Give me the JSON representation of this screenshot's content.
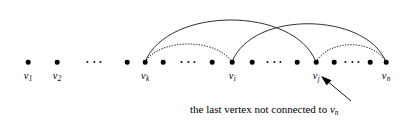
{
  "figure": {
    "width": 404,
    "height": 126,
    "background": "#ffffff",
    "ink_color": "#000000"
  },
  "vertices": [
    {
      "id": "v1",
      "label": "v",
      "sub": "1",
      "x": 28,
      "y": 62,
      "labeled": true
    },
    {
      "id": "v2",
      "label": "v",
      "sub": "2",
      "x": 57,
      "y": 62,
      "labeled": true
    },
    {
      "id": "a1",
      "label": "",
      "sub": "",
      "x": 127,
      "y": 62,
      "labeled": false
    },
    {
      "id": "vk",
      "label": "v",
      "sub": "k",
      "x": 145,
      "y": 62,
      "labeled": true
    },
    {
      "id": "a2",
      "label": "",
      "sub": "",
      "x": 163,
      "y": 62,
      "labeled": false
    },
    {
      "id": "a3",
      "label": "",
      "sub": "",
      "x": 212,
      "y": 62,
      "labeled": false
    },
    {
      "id": "vi",
      "label": "v",
      "sub": "i",
      "x": 232,
      "y": 62,
      "labeled": true
    },
    {
      "id": "a4",
      "label": "",
      "sub": "",
      "x": 252,
      "y": 62,
      "labeled": false
    },
    {
      "id": "a5",
      "label": "",
      "sub": "",
      "x": 297,
      "y": 62,
      "labeled": false
    },
    {
      "id": "vj",
      "label": "v",
      "sub": "j",
      "x": 316,
      "y": 62,
      "labeled": true
    },
    {
      "id": "a6",
      "label": "",
      "sub": "",
      "x": 334,
      "y": 62,
      "labeled": false
    },
    {
      "id": "a7",
      "label": "",
      "sub": "",
      "x": 370,
      "y": 62,
      "labeled": false
    },
    {
      "id": "vn",
      "label": "v",
      "sub": "n",
      "x": 386,
      "y": 62,
      "labeled": true
    }
  ],
  "ellipses": [
    {
      "id": "gap-left",
      "x": 94,
      "y": 62,
      "dots": 3
    },
    {
      "id": "gap-k-i",
      "x": 188,
      "y": 62,
      "dots": 3
    },
    {
      "id": "gap-i-j",
      "x": 274,
      "y": 62,
      "dots": 3
    },
    {
      "id": "gap-j-n",
      "x": 352,
      "y": 62,
      "dots": 3
    }
  ],
  "arcs": [
    {
      "id": "arc-vk-vj",
      "from": "vk",
      "to": "vj",
      "style": "solid",
      "peak_y": 14
    },
    {
      "id": "arc-vi-vn",
      "from": "vi",
      "to": "vn",
      "style": "solid",
      "peak_y": 18
    },
    {
      "id": "arc-vk-vi",
      "from": "vk",
      "to": "vi",
      "style": "dotted",
      "peak_y": 44
    },
    {
      "id": "arc-vj-vn",
      "from": "vj",
      "to": "vn",
      "style": "dotted",
      "peak_y": 45
    }
  ],
  "annotation": {
    "text_before": "the last vertex not connected to ",
    "math_symbol": "v",
    "math_sub": "n",
    "text_x": 190,
    "text_y": 108,
    "arrow": {
      "tail_x": 351,
      "tail_y": 101,
      "head_x": 323,
      "head_y": 77
    }
  }
}
